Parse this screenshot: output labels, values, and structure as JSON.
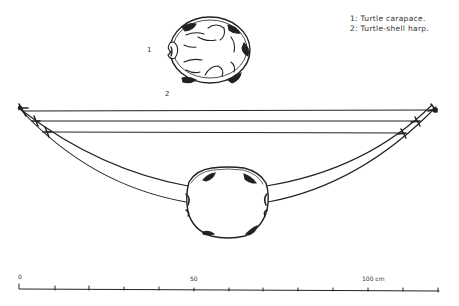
{
  "legend": {
    "items": [
      {
        "label": "1: Turtle carapace."
      },
      {
        "label": "2: Turtle-shell harp."
      }
    ]
  },
  "figure_labels": {
    "carapace": "1",
    "harp": "2"
  },
  "scale_bar": {
    "labels": [
      "0",
      "50",
      "100 cm"
    ],
    "tick_count": 13,
    "unit": "cm"
  },
  "colors": {
    "ink": "#222222",
    "background": "#ffffff"
  }
}
